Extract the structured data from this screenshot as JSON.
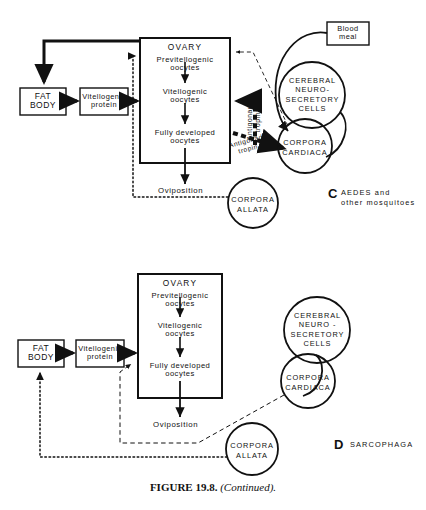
{
  "figure": {
    "caption_bold": "FIGURE 19.8.",
    "caption_italic": "(Continued)."
  },
  "colors": {
    "ink": "#111111",
    "background": "#ffffff"
  },
  "panels": [
    {
      "id": "C",
      "letter": "C",
      "name_line1": "AEDES   and",
      "name_line2": "other  mosquitoes",
      "boxes": {
        "fat_body": {
          "line1": "FAT",
          "line2": "BODY"
        },
        "vitellogenic_protein": {
          "line1": "Vitellogenic",
          "line2": "protein"
        },
        "blood_meal": {
          "line1": "Blood",
          "line2": "meal"
        },
        "ovary": {
          "title": "OVARY",
          "stage1_line1": "Previtellogenic",
          "stage1_line2": "oocytes",
          "stage2_line1": "Vitellogenic",
          "stage2_line2": "oocytes",
          "stage3_line1": "Fully   developed",
          "stage3_line2": "oocytes"
        }
      },
      "circles": {
        "cerebral": {
          "line1": "CEREBRAL",
          "line2": "NEURO-",
          "line3": "SECRETORY",
          "line4": "CELLS"
        },
        "corpora_cardiaca": {
          "line1": "CORPORA",
          "line2": "CARDIACA"
        },
        "corpora_allata": {
          "line1": "CORPORA",
          "line2": "ALLATA"
        }
      },
      "labels": {
        "oviposition": "Oviposition",
        "antigonadotropin_vertical_line1": "Antigonado-",
        "antigonadotropin_vertical_line2": "tropin ?",
        "antigonadotropin_diagonal_line1": "Antigonado-",
        "antigonadotropin_diagonal_line2": "tropin ?"
      }
    },
    {
      "id": "D",
      "letter": "D",
      "name_line1": "SARCOPHAGA",
      "name_line2": "",
      "boxes": {
        "fat_body": {
          "line1": "FAT",
          "line2": "BODY"
        },
        "vitellogenic_protein": {
          "line1": "Vitellogenic",
          "line2": "protein"
        },
        "ovary": {
          "title": "OVARY",
          "stage1_line1": "Previtellogenic",
          "stage1_line2": "oocytes",
          "stage2_line1": "Vitellogenic",
          "stage2_line2": "oocytes",
          "stage3_line1": "Fully   developed",
          "stage3_line2": "oocytes"
        }
      },
      "circles": {
        "cerebral": {
          "line1": "CEREBRAL",
          "line2": "NEURO -",
          "line3": "SECRETORY",
          "line4": "CELLS"
        },
        "corpora_cardiaca": {
          "line1": "CORPORA",
          "line2": "CARDIACA"
        },
        "corpora_allata": {
          "line1": "CORPORA",
          "line2": "ALLATA"
        }
      },
      "labels": {
        "oviposition": "Oviposition"
      }
    }
  ]
}
